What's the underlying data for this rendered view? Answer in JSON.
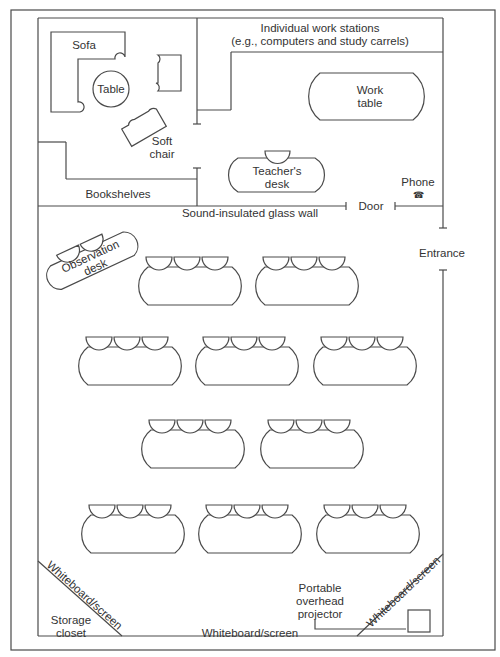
{
  "diagram": {
    "type": "classroom-floor-plan",
    "labels": {
      "sofa": "Sofa",
      "table": "Table",
      "soft_chair_1": "Soft",
      "soft_chair_2": "chair",
      "bookshelves": "Bookshelves",
      "work_stations_1": "Individual work stations",
      "work_stations_2": "(e.g., computers and study carrels)",
      "work_table_1": "Work",
      "work_table_2": "table",
      "teachers_desk_1": "Teacher's",
      "teachers_desk_2": "desk",
      "phone": "Phone",
      "phone_icon": "☎",
      "door": "Door",
      "glass_wall": "Sound-insulated glass wall",
      "entrance": "Entrance",
      "observation_desk_1": "Observation",
      "observation_desk_2": "desk",
      "whiteboard_left": "Whiteboard/screen",
      "whiteboard_bottom": "Whiteboard/screen",
      "whiteboard_right": "Whiteboard/screen",
      "storage_1": "Storage",
      "storage_2": "closet",
      "projector_1": "Portable",
      "projector_2": "overhead",
      "projector_3": "projector"
    },
    "student_table_rows": [
      {
        "row": 1,
        "tables": 2,
        "seats_per_table": 3
      },
      {
        "row": 2,
        "tables": 3,
        "seats_per_table": 3
      },
      {
        "row": 3,
        "tables": 2,
        "seats_per_table": 3
      },
      {
        "row": 4,
        "tables": 3,
        "seats_per_table": 3
      }
    ],
    "colors": {
      "line": "#4a4a4a",
      "text": "#333333",
      "background": "#ffffff"
    }
  }
}
